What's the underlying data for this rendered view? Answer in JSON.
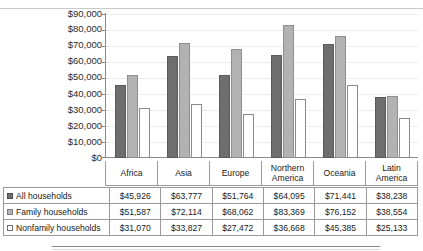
{
  "chart_data": {
    "type": "bar",
    "title": "",
    "xlabel": "",
    "ylabel": "",
    "grid": true,
    "legend_position": "table-left",
    "ylim": [
      0,
      90000
    ],
    "ytick_labels": [
      "$90,000",
      "$80,000",
      "$70,000",
      "$60,000",
      "$50,000",
      "$40,000",
      "$30,000",
      "$20,000",
      "$10,000",
      "$0"
    ],
    "ytick_values": [
      90000,
      80000,
      70000,
      60000,
      50000,
      40000,
      30000,
      20000,
      10000,
      0
    ],
    "categories": [
      "Africa",
      "Asia",
      "Europe",
      "Northern America",
      "Oceania",
      "Latin America"
    ],
    "series": [
      {
        "name": "All households",
        "swatch": "dark-gray",
        "color": "#6e6e6e",
        "values": [
          45926,
          63777,
          51764,
          64095,
          71441,
          38238
        ],
        "labels": [
          "$45,926",
          "$63,777",
          "$51,764",
          "$64,095",
          "$71,441",
          "$38,238"
        ]
      },
      {
        "name": "Family households",
        "swatch": "medium-gray",
        "color": "#b2b2b2",
        "values": [
          51587,
          72114,
          68062,
          83369,
          76152,
          38554
        ],
        "labels": [
          "$51,587",
          "$72,114",
          "$68,062",
          "$83,369",
          "$76,152",
          "$38,554"
        ]
      },
      {
        "name": "Nonfamily households",
        "swatch": "white",
        "color": "#ffffff",
        "values": [
          31070,
          33827,
          27472,
          36668,
          45385,
          25133
        ],
        "labels": [
          "$31,070",
          "$33,827",
          "$27,472",
          "$36,668",
          "$45,385",
          "$25,133"
        ]
      }
    ]
  },
  "colors": {
    "series_all": "#6e6e6e",
    "series_family": "#b2b2b2",
    "series_nonfamily": "#ffffff",
    "axis": "#8a8a8a",
    "grid": "#ededed",
    "table_border": "#9a9a9a"
  }
}
